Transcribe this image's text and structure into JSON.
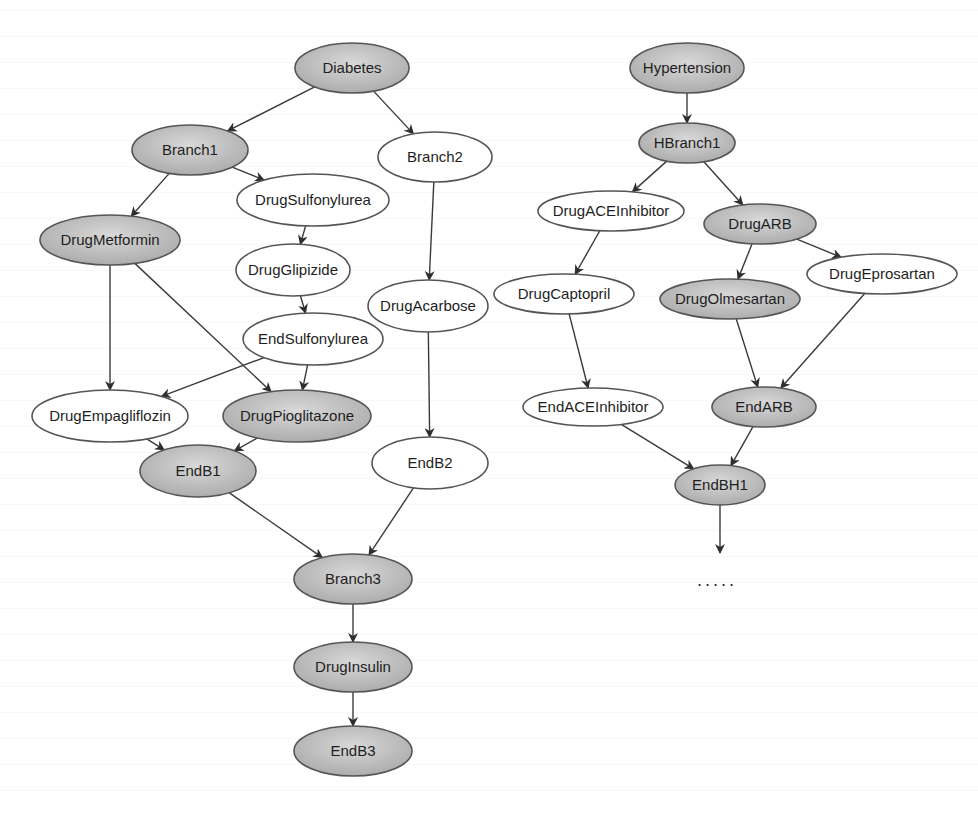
{
  "diagram": {
    "title": "",
    "colors": {
      "selected_fill": "#b8b8b8",
      "selected_fill_light": "#d6d6d6",
      "unselected_fill": "#ffffff",
      "stroke": "#555555",
      "text": "#1e1e1e"
    },
    "graphs": [
      {
        "name": "Diabetes",
        "nodes": [
          {
            "id": "Diabetes",
            "label": "Diabetes",
            "cx": 352,
            "cy": 68,
            "rx": 57,
            "ry": 25,
            "shaded": true
          },
          {
            "id": "Branch1",
            "label": "Branch1",
            "cx": 190,
            "cy": 150,
            "rx": 58,
            "ry": 25,
            "shaded": true
          },
          {
            "id": "Branch2",
            "label": "Branch2",
            "cx": 435,
            "cy": 157,
            "rx": 57,
            "ry": 25,
            "shaded": false
          },
          {
            "id": "DrugSulfonylurea",
            "label": "DrugSulfonylurea",
            "cx": 313,
            "cy": 200,
            "rx": 76,
            "ry": 26,
            "shaded": false
          },
          {
            "id": "DrugMetformin",
            "label": "DrugMetformin",
            "cx": 110,
            "cy": 240,
            "rx": 70,
            "ry": 25,
            "shaded": true
          },
          {
            "id": "DrugGlipizide",
            "label": "DrugGlipizide",
            "cx": 293,
            "cy": 270,
            "rx": 57,
            "ry": 26,
            "shaded": false
          },
          {
            "id": "DrugAcarbose",
            "label": "DrugAcarbose",
            "cx": 428,
            "cy": 306,
            "rx": 60,
            "ry": 26,
            "shaded": false
          },
          {
            "id": "EndSulfonylurea",
            "label": "EndSulfonylurea",
            "cx": 313,
            "cy": 339,
            "rx": 70,
            "ry": 26,
            "shaded": false
          },
          {
            "id": "DrugEmpagliflozin",
            "label": "DrugEmpagliflozin",
            "cx": 110,
            "cy": 416,
            "rx": 78,
            "ry": 26,
            "shaded": false
          },
          {
            "id": "DrugPioglitazone",
            "label": "DrugPioglitazone",
            "cx": 297,
            "cy": 416,
            "rx": 74,
            "ry": 26,
            "shaded": true
          },
          {
            "id": "EndB1",
            "label": "EndB1",
            "cx": 198,
            "cy": 471,
            "rx": 58,
            "ry": 26,
            "shaded": true
          },
          {
            "id": "EndB2",
            "label": "EndB2",
            "cx": 430,
            "cy": 463,
            "rx": 58,
            "ry": 26,
            "shaded": false
          },
          {
            "id": "Branch3",
            "label": "Branch3",
            "cx": 353,
            "cy": 579,
            "rx": 59,
            "ry": 25,
            "shaded": true
          },
          {
            "id": "DrugInsulin",
            "label": "DrugInsulin",
            "cx": 353,
            "cy": 667,
            "rx": 59,
            "ry": 25,
            "shaded": true
          },
          {
            "id": "EndB3",
            "label": "EndB3",
            "cx": 353,
            "cy": 751,
            "rx": 59,
            "ry": 25,
            "shaded": true
          }
        ],
        "edges": [
          [
            "Diabetes",
            "Branch1"
          ],
          [
            "Diabetes",
            "Branch2"
          ],
          [
            "Branch1",
            "DrugMetformin"
          ],
          [
            "Branch1",
            "DrugSulfonylurea"
          ],
          [
            "DrugSulfonylurea",
            "DrugGlipizide"
          ],
          [
            "DrugGlipizide",
            "EndSulfonylurea"
          ],
          [
            "DrugMetformin",
            "DrugEmpagliflozin"
          ],
          [
            "DrugMetformin",
            "DrugPioglitazone"
          ],
          [
            "EndSulfonylurea",
            "DrugEmpagliflozin"
          ],
          [
            "EndSulfonylurea",
            "DrugPioglitazone"
          ],
          [
            "DrugEmpagliflozin",
            "EndB1"
          ],
          [
            "DrugPioglitazone",
            "EndB1"
          ],
          [
            "Branch2",
            "DrugAcarbose"
          ],
          [
            "DrugAcarbose",
            "EndB2"
          ],
          [
            "EndB1",
            "Branch3"
          ],
          [
            "EndB2",
            "Branch3"
          ],
          [
            "Branch3",
            "DrugInsulin"
          ],
          [
            "DrugInsulin",
            "EndB3"
          ]
        ]
      },
      {
        "name": "Hypertension",
        "nodes": [
          {
            "id": "Hypertension",
            "label": "Hypertension",
            "cx": 687,
            "cy": 68,
            "rx": 57,
            "ry": 25,
            "shaded": true
          },
          {
            "id": "HBranch1",
            "label": "HBranch1",
            "cx": 687,
            "cy": 143,
            "rx": 48,
            "ry": 20,
            "shaded": true
          },
          {
            "id": "DrugACEInhibitor",
            "label": "DrugACEInhibitor",
            "cx": 611,
            "cy": 211,
            "rx": 73,
            "ry": 20,
            "shaded": false
          },
          {
            "id": "DrugARB",
            "label": "DrugARB",
            "cx": 760,
            "cy": 224,
            "rx": 56,
            "ry": 20,
            "shaded": true
          },
          {
            "id": "DrugCaptopril",
            "label": "DrugCaptopril",
            "cx": 564,
            "cy": 294,
            "rx": 70,
            "ry": 20,
            "shaded": false
          },
          {
            "id": "DrugOlmesartan",
            "label": "DrugOlmesartan",
            "cx": 730,
            "cy": 299,
            "rx": 70,
            "ry": 20,
            "shaded": true
          },
          {
            "id": "DrugEprosartan",
            "label": "DrugEprosartan",
            "cx": 882,
            "cy": 274,
            "rx": 75,
            "ry": 20,
            "shaded": false
          },
          {
            "id": "EndACEInhibitor",
            "label": "EndACEInhibitor",
            "cx": 593,
            "cy": 407,
            "rx": 70,
            "ry": 19,
            "shaded": false
          },
          {
            "id": "EndARB",
            "label": "EndARB",
            "cx": 764,
            "cy": 407,
            "rx": 52,
            "ry": 20,
            "shaded": true
          },
          {
            "id": "EndBH1",
            "label": "EndBH1",
            "cx": 720,
            "cy": 485,
            "rx": 45,
            "ry": 20,
            "shaded": true
          }
        ],
        "edges": [
          [
            "Hypertension",
            "HBranch1"
          ],
          [
            "HBranch1",
            "DrugACEInhibitor"
          ],
          [
            "HBranch1",
            "DrugARB"
          ],
          [
            "DrugACEInhibitor",
            "DrugCaptopril"
          ],
          [
            "DrugARB",
            "DrugOlmesartan"
          ],
          [
            "DrugARB",
            "DrugEprosartan"
          ],
          [
            "DrugCaptopril",
            "EndACEInhibitor"
          ],
          [
            "DrugOlmesartan",
            "EndARB"
          ],
          [
            "DrugEprosartan",
            "EndARB"
          ],
          [
            "EndACEInhibitor",
            "EndBH1"
          ],
          [
            "EndARB",
            "EndBH1"
          ]
        ],
        "continuation": {
          "from": "EndBH1",
          "x": 720,
          "y_end": 553,
          "text": ".....",
          "text_x": 717,
          "text_y": 586
        }
      }
    ]
  }
}
